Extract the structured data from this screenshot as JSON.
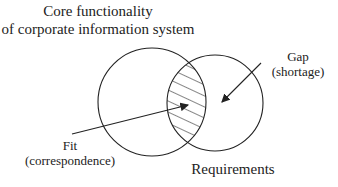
{
  "title": {
    "line1": "Core functionality",
    "line2": "of corporate information system"
  },
  "gap": {
    "line1": "Gap",
    "line2": "(shortage)"
  },
  "fit": {
    "line1": "Fit",
    "line2": "(correspondence)"
  },
  "requirements": "Requirements",
  "colors": {
    "stroke": "#222222",
    "background": "#ffffff"
  }
}
